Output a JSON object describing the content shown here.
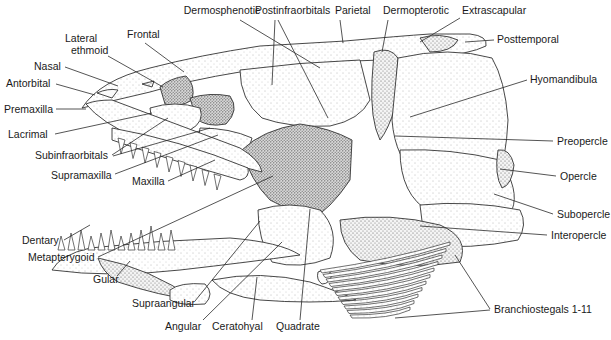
{
  "diagram": {
    "labels": [
      {
        "id": "dermosphenotic",
        "text": "Dermosphenotic",
        "x": 222,
        "y": 14,
        "anchor": "middle",
        "line": [
          [
            240,
            20
          ],
          [
            320,
            68
          ]
        ]
      },
      {
        "id": "postinfraorbitals",
        "text": "Postinfraorbitals",
        "x": 255,
        "y": 14,
        "anchor": "start",
        "line": [
          [
            275,
            20
          ],
          [
            272,
            85
          ]
        ],
        "line2": [
          [
            278,
            20
          ],
          [
            328,
            118
          ]
        ]
      },
      {
        "id": "parietal",
        "text": "Parietal",
        "x": 335,
        "y": 14,
        "anchor": "start",
        "line": [
          [
            340,
            20
          ],
          [
            343,
            43
          ]
        ]
      },
      {
        "id": "dermopterotic",
        "text": "Dermopterotic",
        "x": 383,
        "y": 14,
        "anchor": "start",
        "line": [
          [
            388,
            20
          ],
          [
            382,
            52
          ]
        ]
      },
      {
        "id": "extrascapular",
        "text": "Extrascapular",
        "x": 462,
        "y": 14,
        "anchor": "start",
        "line": [
          [
            460,
            18
          ],
          [
            420,
            42
          ]
        ]
      },
      {
        "id": "posttemporal",
        "text": "Posttemporal",
        "x": 497,
        "y": 43,
        "anchor": "start",
        "line": [
          [
            494,
            40
          ],
          [
            465,
            42
          ]
        ]
      },
      {
        "id": "frontal",
        "text": "Frontal",
        "x": 127,
        "y": 38,
        "anchor": "start",
        "line": [
          [
            145,
            43
          ],
          [
            184,
            72
          ]
        ]
      },
      {
        "id": "lateral-ethmoid",
        "text": "Lateral",
        "text2": "ethmoid",
        "x": 65,
        "y": 42,
        "anchor": "start",
        "line": [
          [
            108,
            56
          ],
          [
            163,
            87
          ]
        ]
      },
      {
        "id": "nasal",
        "text": "Nasal",
        "x": 34,
        "y": 70,
        "anchor": "start",
        "line": [
          [
            65,
            67
          ],
          [
            118,
            86
          ]
        ]
      },
      {
        "id": "antorbital",
        "text": "Antorbital",
        "x": 6,
        "y": 87,
        "anchor": "start",
        "line": [
          [
            56,
            84
          ],
          [
            95,
            95
          ]
        ]
      },
      {
        "id": "premaxilla",
        "text": "Premaxilla",
        "x": 4,
        "y": 113,
        "anchor": "start",
        "line": [
          [
            56,
            109
          ],
          [
            86,
            109
          ]
        ]
      },
      {
        "id": "hyomandibula",
        "text": "Hyomandibula",
        "x": 530,
        "y": 83,
        "anchor": "start",
        "line": [
          [
            527,
            80
          ],
          [
            410,
            117
          ]
        ]
      },
      {
        "id": "lacrimal",
        "text": "Lacrimal",
        "x": 8,
        "y": 138,
        "anchor": "start",
        "line": [
          [
            55,
            134
          ],
          [
            152,
            113
          ]
        ]
      },
      {
        "id": "preopercle",
        "text": "Preopercle",
        "x": 557,
        "y": 145,
        "anchor": "start",
        "line": [
          [
            553,
            141
          ],
          [
            395,
            136
          ]
        ]
      },
      {
        "id": "subinfraorbitals",
        "text": "Subinfraorbitals",
        "x": 35,
        "y": 159,
        "anchor": "start",
        "line": [
          [
            112,
            155
          ],
          [
            168,
            118
          ]
        ],
        "line2": [
          [
            113,
            156
          ],
          [
            210,
            128
          ]
        ]
      },
      {
        "id": "opercle",
        "text": "Opercle",
        "x": 560,
        "y": 180,
        "anchor": "start",
        "line": [
          [
            556,
            176
          ],
          [
            500,
            169
          ]
        ]
      },
      {
        "id": "supramaxilla",
        "text": "Supramaxilla",
        "x": 51,
        "y": 179,
        "anchor": "start",
        "line": [
          [
            115,
            174
          ],
          [
            218,
            135
          ]
        ]
      },
      {
        "id": "maxilla",
        "text": "Maxilla",
        "x": 132,
        "y": 185,
        "anchor": "start",
        "line": [
          [
            168,
            181
          ],
          [
            215,
            160
          ]
        ]
      },
      {
        "id": "subopercle",
        "text": "Subopercle",
        "x": 557,
        "y": 218,
        "anchor": "start",
        "line": [
          [
            553,
            214
          ],
          [
            494,
            194
          ]
        ]
      },
      {
        "id": "interopercle",
        "text": "Interopercle",
        "x": 551,
        "y": 239,
        "anchor": "start",
        "line": [
          [
            547,
            235
          ],
          [
            420,
            226
          ]
        ]
      },
      {
        "id": "dentary",
        "text": "Dentary",
        "x": 22,
        "y": 244,
        "anchor": "start",
        "line": [
          [
            64,
            240
          ],
          [
            90,
            225
          ]
        ]
      },
      {
        "id": "metapterygoid",
        "text": "Metapterygoid",
        "x": 28,
        "y": 261,
        "anchor": "start",
        "line": [
          [
            98,
            257
          ],
          [
            273,
            176
          ]
        ]
      },
      {
        "id": "gular",
        "text": "Gular",
        "x": 93,
        "y": 283,
        "anchor": "start",
        "line": [
          [
            117,
            276
          ],
          [
            130,
            261
          ]
        ]
      },
      {
        "id": "supraangular",
        "text": "Supraangular",
        "x": 132,
        "y": 307,
        "anchor": "start",
        "line": [
          [
            195,
            301
          ],
          [
            260,
            221
          ]
        ]
      },
      {
        "id": "angular",
        "text": "Angular",
        "x": 165,
        "y": 330,
        "anchor": "start",
        "line": [
          [
            203,
            320
          ],
          [
            282,
            242
          ]
        ]
      },
      {
        "id": "ceratohyal",
        "text": "Ceratohyal",
        "x": 212,
        "y": 330,
        "anchor": "start",
        "line": [
          [
            252,
            320
          ],
          [
            257,
            277
          ]
        ]
      },
      {
        "id": "quadrate",
        "text": "Quadrate",
        "x": 276,
        "y": 330,
        "anchor": "start",
        "line": [
          [
            300,
            320
          ],
          [
            310,
            209
          ]
        ]
      },
      {
        "id": "branchiostegals",
        "text": "Branchiostegals 1-11",
        "x": 494,
        "y": 313,
        "anchor": "start",
        "line": [
          [
            490,
            309
          ],
          [
            455,
            255
          ]
        ],
        "line2": [
          [
            490,
            310
          ],
          [
            395,
            318
          ]
        ]
      }
    ]
  }
}
